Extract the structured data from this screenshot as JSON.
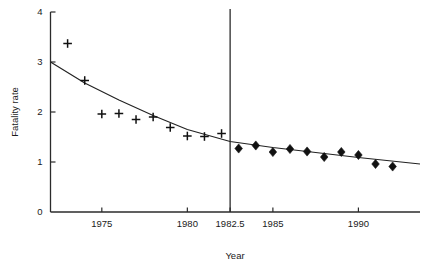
{
  "chart_data": {
    "type": "scatter",
    "title": "",
    "xlabel": "Year",
    "ylabel": "Fatality rate",
    "xlim": [
      1972.0,
      1993.6
    ],
    "ylim": [
      0,
      4
    ],
    "grid": false,
    "legend": null,
    "x_ticks": [
      {
        "value": 1975,
        "label": "1975"
      },
      {
        "value": 1980,
        "label": "1980"
      },
      {
        "value": 1982.5,
        "label": "1982.5"
      },
      {
        "value": 1985,
        "label": "1985"
      },
      {
        "value": 1990,
        "label": "1990"
      }
    ],
    "y_ticks": [
      {
        "value": 0,
        "label": "0"
      },
      {
        "value": 1,
        "label": "1"
      },
      {
        "value": 2,
        "label": "2"
      },
      {
        "value": 3,
        "label": "3"
      },
      {
        "value": 4,
        "label": "4"
      }
    ],
    "annotations": [
      {
        "name": "intervention-line",
        "type": "vline",
        "x": 1982.5,
        "label": "1982.5"
      }
    ],
    "series": [
      {
        "name": "pre-period observations",
        "marker": "plus",
        "x": [
          1973,
          1974,
          1975,
          1976,
          1977,
          1978,
          1979,
          1980,
          1981,
          1982
        ],
        "values": [
          3.37,
          2.63,
          1.96,
          1.97,
          1.85,
          1.9,
          1.69,
          1.52,
          1.51,
          1.57
        ]
      },
      {
        "name": "post-period observations",
        "marker": "diamond",
        "x": [
          1983,
          1984,
          1985,
          1986,
          1987,
          1988,
          1989,
          1990,
          1991,
          1992
        ],
        "values": [
          1.27,
          1.33,
          1.2,
          1.26,
          1.21,
          1.1,
          1.2,
          1.14,
          0.96,
          0.91
        ]
      },
      {
        "name": "fitted trend",
        "marker": "line",
        "x": [
          1972.0,
          1974.0,
          1976.0,
          1978.0,
          1980.0,
          1982.5,
          1985.0,
          1987.5,
          1990.0,
          1993.6
        ],
        "values": [
          3.0,
          2.58,
          2.24,
          1.93,
          1.65,
          1.41,
          1.29,
          1.19,
          1.09,
          0.96
        ]
      }
    ],
    "colors": {
      "axis": "#2b2b2b",
      "marker": "#111111",
      "line": "#222222",
      "background": "#ffffff"
    }
  }
}
